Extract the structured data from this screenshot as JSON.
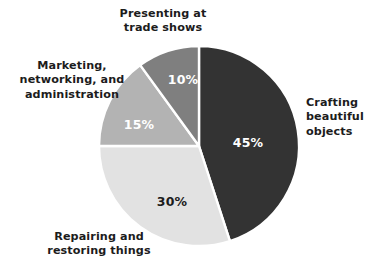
{
  "chart_data": {
    "type": "pie",
    "title": "",
    "subtitle": "",
    "xlabel": "",
    "ylabel": "",
    "legend_position": "callout-labels",
    "grid": false,
    "start_angle_deg": 0,
    "direction": "clockwise",
    "units": "percent",
    "categories": [
      "Crafting beautiful objects",
      "Repairing and restoring things",
      "Marketing, networking, and administration",
      "Presenting at trade shows"
    ],
    "values": [
      45,
      30,
      15,
      10
    ],
    "value_labels": [
      "45%",
      "30%",
      "15%",
      "10%"
    ],
    "colors": [
      "#333333",
      "#e2e2e2",
      "#b3b3b3",
      "#7f7f7f"
    ],
    "slices": [
      {
        "label": "Crafting beautiful objects",
        "label_lines": "Crafting\nbeautiful\nobjects",
        "value": 45,
        "value_label": "45%",
        "color": "#333333",
        "value_text_color": "#ffffff",
        "start_deg": 0,
        "end_deg": 162
      },
      {
        "label": "Repairing and restoring things",
        "label_lines": "Repairing and\nrestoring things",
        "value": 30,
        "value_label": "30%",
        "color": "#e2e2e2",
        "value_text_color": "#1c1c1c",
        "start_deg": 162,
        "end_deg": 270
      },
      {
        "label": "Marketing, networking, and administration",
        "label_lines": "Marketing,\nnetworking, and\nadministration",
        "value": 15,
        "value_label": "15%",
        "color": "#b3b3b3",
        "value_text_color": "#ffffff",
        "start_deg": 270,
        "end_deg": 324
      },
      {
        "label": "Presenting at trade shows",
        "label_lines": "Presenting at\ntrade shows",
        "value": 10,
        "value_label": "10%",
        "color": "#7f7f7f",
        "value_text_color": "#ffffff",
        "start_deg": 324,
        "end_deg": 360
      }
    ]
  },
  "figure": {
    "background": "#ffffff",
    "separator_color": "#ffffff",
    "center_x": 199,
    "center_y": 146,
    "radius": 100
  }
}
